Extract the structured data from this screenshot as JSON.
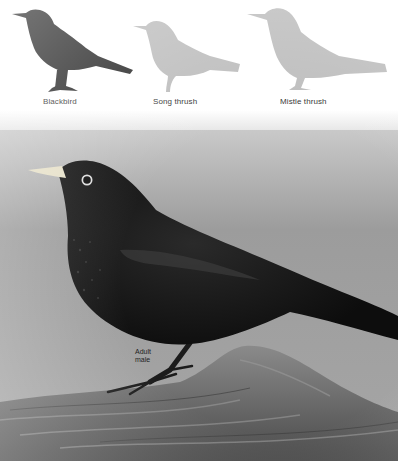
{
  "silhouettes": [
    {
      "label": "Blackbird",
      "color": "#2a2a2a"
    },
    {
      "label": "Song thrush",
      "color": "#bdbdbd"
    },
    {
      "label": "Mistle thrush",
      "color": "#bdbdbd"
    }
  ],
  "photo": {
    "subject": "Blackbird perched on log",
    "caption_line1": "Adult",
    "caption_line2": "male"
  }
}
